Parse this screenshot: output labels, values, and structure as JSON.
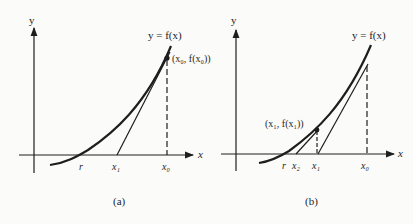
{
  "figure": {
    "colors": {
      "ink": "#1e1e1e",
      "background": "#fbfbf9"
    }
  },
  "panel_a": {
    "caption": "(a)",
    "y_axis_label": "y",
    "x_axis_label": "x",
    "curve_label": "y = f(x)",
    "point_label": "(x₀, f(x₀))",
    "ticks": [
      "r",
      "x₁",
      "x₀"
    ]
  },
  "panel_b": {
    "caption": "(b)",
    "y_axis_label": "y",
    "x_axis_label": "x",
    "curve_label": "y = f(x)",
    "point_label": "(x₁, f(x₁))",
    "ticks": [
      "r",
      "x₂",
      "x₁",
      "x₀"
    ]
  }
}
